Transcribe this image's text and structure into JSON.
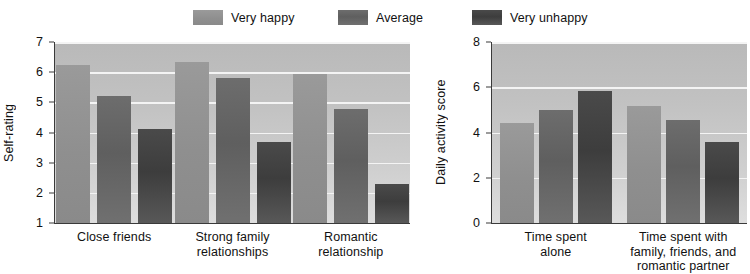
{
  "legend": {
    "items": [
      {
        "label": "Very happy",
        "color": "#8f8f8f"
      },
      {
        "label": "Average",
        "color": "#5f5f5f"
      },
      {
        "label": "Very unhappy",
        "color": "#3d3d3d"
      }
    ]
  },
  "chart_data": [
    {
      "type": "bar",
      "title": "",
      "xlabel": "",
      "ylabel": "Self-rating",
      "ylim": [
        1,
        7
      ],
      "yticks": [
        1,
        2,
        3,
        4,
        5,
        6,
        7
      ],
      "grid": true,
      "legend_position": "top",
      "categories": [
        "Close friends",
        "Strong family relationships",
        "Romantic relationship"
      ],
      "series": [
        {
          "name": "Very happy",
          "values": [
            6.25,
            6.35,
            5.95
          ]
        },
        {
          "name": "Average",
          "values": [
            5.2,
            5.8,
            4.78
          ]
        },
        {
          "name": "Very unhappy",
          "values": [
            4.1,
            3.7,
            2.3
          ]
        }
      ]
    },
    {
      "type": "bar",
      "title": "",
      "xlabel": "",
      "ylabel": "Daily activity score",
      "ylim": [
        0,
        8
      ],
      "yticks": [
        0,
        2,
        4,
        6,
        8
      ],
      "grid": true,
      "legend_position": "top",
      "categories": [
        "Time spent alone",
        "Time spent with family, friends, and romantic partner"
      ],
      "series": [
        {
          "name": "Very happy",
          "values": [
            4.4,
            5.15
          ]
        },
        {
          "name": "Average",
          "values": [
            5.0,
            4.55
          ]
        },
        {
          "name": "Very unhappy",
          "values": [
            5.85,
            3.6
          ]
        }
      ]
    }
  ],
  "left_chart": {
    "y_axis_title": "Self-rating",
    "y_tick_labels": [
      "7",
      "6",
      "5",
      "4",
      "3",
      "2",
      "1"
    ],
    "category_labels": [
      [
        "Close friends"
      ],
      [
        "Strong family",
        "relationships"
      ],
      [
        "Romantic",
        "relationship"
      ]
    ]
  },
  "right_chart": {
    "y_axis_title": "Daily activity score",
    "y_tick_labels": [
      "8",
      "6",
      "4",
      "2",
      "0"
    ],
    "category_labels": [
      [
        "Time spent",
        "alone"
      ],
      [
        "Time spent with",
        "family, friends, and",
        "romantic partner"
      ]
    ]
  }
}
